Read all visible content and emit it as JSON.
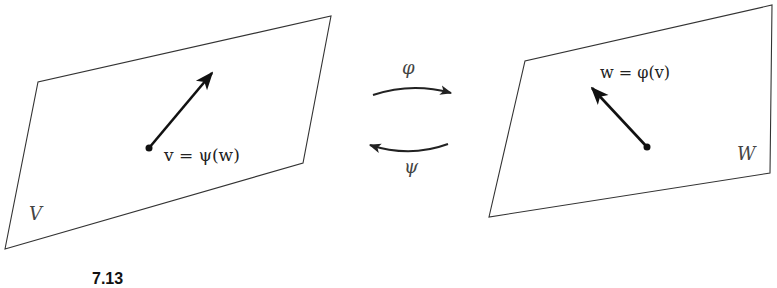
{
  "diagram": {
    "left_space": {
      "name": "V",
      "vector_label": "v = ψ(w)",
      "polygon": [
        [
          5,
          249
        ],
        [
          38,
          82
        ],
        [
          331,
          16
        ],
        [
          303,
          163
        ]
      ],
      "vector": {
        "from": [
          149,
          148
        ],
        "to": [
          213,
          72
        ]
      }
    },
    "right_space": {
      "name": "W",
      "vector_label": "w = φ(v)",
      "polygon": [
        [
          489,
          217
        ],
        [
          525,
          61
        ],
        [
          772,
          5
        ],
        [
          770,
          173
        ]
      ],
      "vector": {
        "from": [
          647,
          147
        ],
        "to": [
          591,
          87
        ]
      }
    },
    "maps": [
      {
        "label": "φ",
        "direction": "V to W"
      },
      {
        "label": "ψ",
        "direction": "W to V"
      }
    ],
    "caption": "7.13",
    "stroke_color": "#333333",
    "vector_color": "#111111"
  }
}
